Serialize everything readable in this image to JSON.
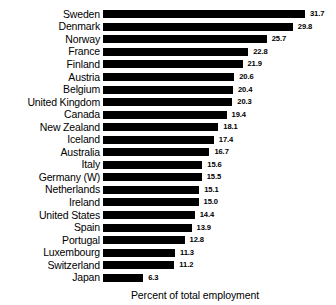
{
  "chart_data": {
    "type": "bar",
    "orientation": "horizontal",
    "title": "",
    "xlabel": "Percent of total employment",
    "ylabel": "",
    "xlim": [
      0,
      31.7
    ],
    "grid": false,
    "legend": null,
    "value_labels": true,
    "categories": [
      "Sweden",
      "Denmark",
      "Norway",
      "France",
      "Finland",
      "Austria",
      "Belgium",
      "United Kingdom",
      "Canada",
      "New Zealand",
      "Iceland",
      "Australia",
      "Italy",
      "Germany (W)",
      "Netherlands",
      "Ireland",
      "United States",
      "Spain",
      "Portugal",
      "Luxembourg",
      "Switzerland",
      "Japan"
    ],
    "values": [
      31.7,
      29.8,
      25.7,
      22.8,
      21.9,
      20.6,
      20.4,
      20.3,
      19.4,
      18.1,
      17.4,
      16.7,
      15.6,
      15.5,
      15.1,
      15.0,
      14.4,
      13.9,
      12.8,
      11.3,
      11.2,
      6.3
    ],
    "value_label_strings": [
      "31.7",
      "29.8",
      "25.7",
      "22.8",
      "21.9",
      "20.6",
      "20.4",
      "20.3",
      "19.4",
      "18.1",
      "17.4",
      "16.7",
      "15.6",
      "15.5",
      "15.1",
      "15.0",
      "14.4",
      "13.9",
      "12.8",
      "11.3",
      "11.2",
      "6.3"
    ],
    "bar_color": "#000000",
    "background_color": "#ffffff"
  },
  "axis": {
    "caption": "Percent of total employment"
  },
  "title_sliver": {
    "text": ""
  }
}
